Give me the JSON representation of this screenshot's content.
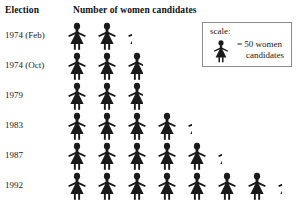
{
  "header": {
    "category_label": "Election",
    "values_label": "Number of women candidates"
  },
  "legend": {
    "title": "scale:",
    "equals_line1": "= 50 women",
    "equals_line2": "candidates",
    "icon": "woman-figure-icon",
    "unit_value": 50
  },
  "colors": {
    "figure": "#1a1a1a",
    "box_border": "#8c8c8c",
    "text": "#1a1a1a",
    "background": "#ffffff"
  },
  "chart_data": {
    "type": "bar",
    "title": "Number of women candidates",
    "xlabel": "Number of women candidates",
    "ylabel": "Election",
    "pictogram": true,
    "unit_per_icon": 50,
    "unit_label": "50 women candidates",
    "categories": [
      "1974 (Feb)",
      "1974 (Oct)",
      "1979",
      "1983",
      "1987",
      "1992"
    ],
    "icons": [
      2.25,
      2.75,
      2.75,
      4.25,
      5.25,
      7.25
    ],
    "values": [
      113,
      138,
      138,
      213,
      263,
      363
    ],
    "xlim": [
      0,
      400
    ],
    "grid": false,
    "legend_position": "top-right"
  },
  "rows": [
    {
      "label": "1974 (Feb)",
      "full": 2,
      "partial": 0.25,
      "value": 113
    },
    {
      "label": "1974 (Oct)",
      "full": 2,
      "partial": 0.75,
      "value": 138
    },
    {
      "label": "1979",
      "full": 2,
      "partial": 0.75,
      "value": 138
    },
    {
      "label": "1983",
      "full": 4,
      "partial": 0.25,
      "value": 213
    },
    {
      "label": "1987",
      "full": 5,
      "partial": 0.25,
      "value": 263
    },
    {
      "label": "1992",
      "full": 7,
      "partial": 0.25,
      "value": 363
    }
  ]
}
